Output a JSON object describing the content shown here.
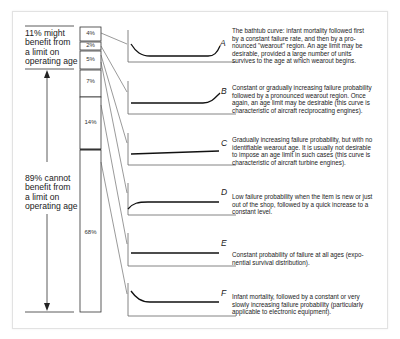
{
  "left_labels": {
    "top": "11% might benefit from a limit on operating age",
    "top_lines": [
      "11% might",
      "benefit from",
      "a limit on",
      "operating age"
    ],
    "bottom": "89% cannot benefit from a limit on operating age",
    "bottom_lines": [
      "89% cannot",
      "benefit from",
      "a limit on",
      "operating age"
    ]
  },
  "bar_segments": [
    {
      "curve": "A",
      "percent": "4%"
    },
    {
      "curve": "B",
      "percent": "2%"
    },
    {
      "curve": "C",
      "percent": "5%"
    },
    {
      "curve": "D",
      "percent": "7%"
    },
    {
      "curve": "E",
      "percent": "14%"
    },
    {
      "curve": "F",
      "percent": "68%"
    }
  ],
  "curves": [
    {
      "letter": "A",
      "shape": "bathtub",
      "description": "The bathtub curve: infant mortality followed first by a constant failure rate, and then by a pronounced \"wearout\" region. An age limit may be desirable, provided a large number of units survives to the age at which wearout begins.",
      "lines": [
        "The bathtub curve: infant mortality followed first",
        "by a constant failure rate, and then by a pro-",
        "nounced \"wearout\" region. An age limit may be",
        "desirable, provided a large number of units",
        "survives to the age at which wearout begins."
      ]
    },
    {
      "letter": "B",
      "shape": "constant-then-wearout",
      "description": "Constant or gradually increasing failure probability followed by a pronounced wearout region. Once again, an age limit may be desirable (this curve is characteristic of aircraft reciprocating engines).",
      "lines": [
        "Constant or gradually increasing failure probability",
        "followed by a pronounced wearout region. Once",
        "again, an age limit may be desirable (this curve is",
        "characteristic of aircraft reciprocating engines)."
      ]
    },
    {
      "letter": "C",
      "shape": "gradually-increasing",
      "description": "Gradually increasing failure probability, but with no identifiable wearout age. It is usually not desirable to impose an age limit in such cases (this curve is characteristic of aircraft turbine engines).",
      "lines": [
        "Gradually increasing failure probability, but with no",
        "identifiable wearout age. It is usually not desirable",
        "to impose an age limit in such cases (this curve is",
        "characteristic of aircraft turbine engines)."
      ]
    },
    {
      "letter": "D",
      "shape": "low-then-constant",
      "description": "Low failure probability when the item is new or just out of the shop, followed by a quick increase to a constant level.",
      "lines": [
        "Low failure probability when the item is new or just",
        "out of the shop, followed by a quick increase to a",
        "constant level."
      ]
    },
    {
      "letter": "E",
      "shape": "constant",
      "description": "Constant probability of failure at all ages (exponential survival distribution).",
      "lines": [
        "Constant probability of failure at all ages (expo-",
        "nential survival distribution)."
      ]
    },
    {
      "letter": "F",
      "shape": "infant-mortality",
      "description": "Infant mortality, followed by a constant or very slowly increasing failure probability (particularly applicable to electronic equipment).",
      "lines": [
        "Infant mortality, followed by a constant or very",
        "slowly increasing failure probability (particularly",
        "applicable to electronic equipment)."
      ]
    }
  ],
  "colors": {
    "line": "#222222",
    "frame": "#e2e2e2",
    "connector": "#555555"
  }
}
